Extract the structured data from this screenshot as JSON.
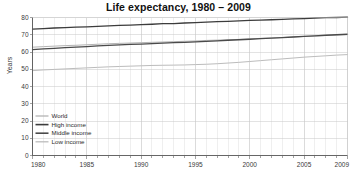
{
  "chart_data": {
    "type": "line",
    "title": "Life expectancy, 1980 – 2009",
    "xlabel": "",
    "ylabel": "Years",
    "xlim": [
      1980,
      2009
    ],
    "ylim": [
      0,
      80
    ],
    "yticks": [
      0,
      10,
      20,
      30,
      40,
      50,
      60,
      70,
      80
    ],
    "ytick_labels": [
      "0",
      "10",
      "20",
      "30",
      "40",
      "50",
      "60",
      "70",
      "80"
    ],
    "xticks": [
      1980,
      1985,
      1990,
      1995,
      2000,
      2005,
      2009
    ],
    "xtick_labels": [
      "1980",
      "1985",
      "1990",
      "1995",
      "2000",
      "2005",
      "2009"
    ],
    "x_minor_step": 1,
    "grid": true,
    "legend_position": "lower-left",
    "x": [
      1980,
      1981,
      1982,
      1983,
      1984,
      1985,
      1986,
      1987,
      1988,
      1989,
      1990,
      1991,
      1992,
      1993,
      1994,
      1995,
      1996,
      1997,
      1998,
      1999,
      2000,
      2001,
      2002,
      2003,
      2004,
      2005,
      2006,
      2007,
      2008,
      2009
    ],
    "series": [
      {
        "name": "World",
        "color": "#b4b4b4",
        "width": 1.0,
        "values": [
          62.8,
          63.1,
          63.4,
          63.7,
          63.9,
          64.2,
          64.5,
          64.8,
          65.0,
          65.2,
          65.4,
          65.6,
          65.8,
          66.0,
          66.2,
          66.4,
          66.7,
          66.9,
          67.1,
          67.3,
          67.6,
          67.9,
          68.1,
          68.4,
          68.7,
          69.0,
          69.3,
          69.6,
          69.9,
          70.1
        ]
      },
      {
        "name": "High income",
        "color": "#3c3c3c",
        "width": 1.3,
        "values": [
          73.3,
          73.6,
          73.9,
          74.1,
          74.4,
          74.6,
          74.9,
          75.2,
          75.4,
          75.6,
          75.9,
          76.1,
          76.4,
          76.5,
          76.8,
          77.0,
          77.3,
          77.6,
          77.8,
          78.0,
          78.3,
          78.5,
          78.7,
          78.9,
          79.2,
          79.4,
          79.7,
          79.9,
          80.0,
          80.2
        ]
      },
      {
        "name": "Middle income",
        "color": "#4a4a4a",
        "width": 1.3,
        "values": [
          61.4,
          61.8,
          62.1,
          62.5,
          62.8,
          63.1,
          63.5,
          63.8,
          64.1,
          64.4,
          64.6,
          64.9,
          65.1,
          65.4,
          65.6,
          65.9,
          66.2,
          66.5,
          66.8,
          67.1,
          67.4,
          67.7,
          68.0,
          68.3,
          68.7,
          69.0,
          69.4,
          69.7,
          70.0,
          70.3
        ]
      },
      {
        "name": "Low income",
        "color": "#bcbcbc",
        "width": 1.0,
        "values": [
          49.2,
          49.6,
          49.9,
          50.2,
          50.5,
          50.8,
          51.1,
          51.4,
          51.6,
          51.8,
          52.0,
          52.2,
          52.3,
          52.4,
          52.5,
          52.7,
          52.9,
          53.2,
          53.6,
          54.0,
          54.5,
          55.0,
          55.5,
          56.0,
          56.5,
          57.0,
          57.4,
          57.8,
          58.2,
          58.5
        ]
      }
    ]
  },
  "legend": {
    "items": [
      {
        "label": "World"
      },
      {
        "label": "High income"
      },
      {
        "label": "Middle income"
      },
      {
        "label": "Low income"
      }
    ]
  }
}
